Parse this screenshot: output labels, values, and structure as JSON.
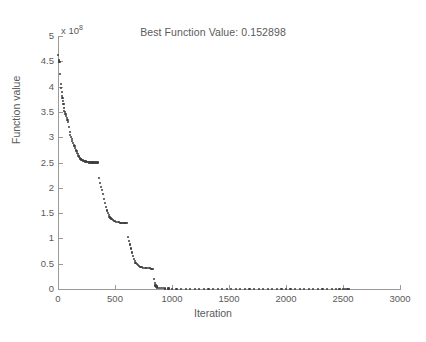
{
  "chart_data": {
    "type": "scatter",
    "title": "Best Function Value: 0.152898",
    "xlabel": "Iteration",
    "ylabel": "Function value",
    "y_exponent_prefix": "x 10",
    "y_exponent_power": "8",
    "y_scale_factor": 100000000,
    "xlim": [
      0,
      3000
    ],
    "ylim": [
      0,
      500000000
    ],
    "xticks": [
      0,
      500,
      1000,
      1500,
      2000,
      2500,
      3000
    ],
    "xtick_labels": [
      "0",
      "500",
      "1000",
      "1500",
      "2000",
      "2500",
      "3000"
    ],
    "yticks": [
      0,
      0.5,
      1,
      1.5,
      2,
      2.5,
      3,
      3.5,
      4,
      4.5,
      5
    ],
    "ytick_labels": [
      "0",
      "0.5",
      "1",
      "1.5",
      "2",
      "2.5",
      "3",
      "3.5",
      "4",
      "4.5",
      "5"
    ],
    "grid": false,
    "legend": null,
    "marker_color": "#3d3d3d",
    "axis_color": "#9a9a9a",
    "text_color": "#5a5a5a",
    "series_name": "Best function value per iteration",
    "note": "Monotone decreasing staircase; y values expressed in units of 1e8",
    "points": [
      [
        2,
        4.62
      ],
      [
        6,
        4.52
      ],
      [
        10,
        4.5
      ],
      [
        14,
        4.48
      ],
      [
        20,
        4.25
      ],
      [
        24,
        4.05
      ],
      [
        28,
        3.98
      ],
      [
        32,
        3.9
      ],
      [
        36,
        3.82
      ],
      [
        40,
        3.78
      ],
      [
        44,
        3.72
      ],
      [
        48,
        3.66
      ],
      [
        52,
        3.58
      ],
      [
        56,
        3.52
      ],
      [
        60,
        3.5
      ],
      [
        66,
        3.46
      ],
      [
        72,
        3.42
      ],
      [
        78,
        3.38
      ],
      [
        84,
        3.34
      ],
      [
        90,
        3.3
      ],
      [
        96,
        3.2
      ],
      [
        102,
        3.1
      ],
      [
        108,
        3.05
      ],
      [
        114,
        3.0
      ],
      [
        120,
        2.96
      ],
      [
        126,
        2.92
      ],
      [
        132,
        2.88
      ],
      [
        138,
        2.85
      ],
      [
        144,
        2.82
      ],
      [
        150,
        2.78
      ],
      [
        156,
        2.75
      ],
      [
        162,
        2.72
      ],
      [
        168,
        2.69
      ],
      [
        174,
        2.66
      ],
      [
        180,
        2.63
      ],
      [
        186,
        2.61
      ],
      [
        192,
        2.59
      ],
      [
        198,
        2.57
      ],
      [
        204,
        2.56
      ],
      [
        212,
        2.55
      ],
      [
        220,
        2.54
      ],
      [
        228,
        2.53
      ],
      [
        236,
        2.52
      ],
      [
        244,
        2.52
      ],
      [
        252,
        2.51
      ],
      [
        262,
        2.51
      ],
      [
        272,
        2.5
      ],
      [
        282,
        2.5
      ],
      [
        292,
        2.5
      ],
      [
        302,
        2.5
      ],
      [
        312,
        2.5
      ],
      [
        322,
        2.5
      ],
      [
        332,
        2.5
      ],
      [
        342,
        2.5
      ],
      [
        352,
        2.5
      ],
      [
        362,
        2.2
      ],
      [
        372,
        2.1
      ],
      [
        380,
        2.02
      ],
      [
        388,
        1.95
      ],
      [
        396,
        1.88
      ],
      [
        404,
        1.78
      ],
      [
        412,
        1.7
      ],
      [
        420,
        1.62
      ],
      [
        428,
        1.55
      ],
      [
        436,
        1.5
      ],
      [
        444,
        1.46
      ],
      [
        452,
        1.42
      ],
      [
        460,
        1.4
      ],
      [
        470,
        1.38
      ],
      [
        480,
        1.36
      ],
      [
        490,
        1.35
      ],
      [
        500,
        1.34
      ],
      [
        512,
        1.33
      ],
      [
        524,
        1.32
      ],
      [
        536,
        1.32
      ],
      [
        548,
        1.31
      ],
      [
        560,
        1.31
      ],
      [
        572,
        1.3
      ],
      [
        584,
        1.3
      ],
      [
        596,
        1.3
      ],
      [
        608,
        1.3
      ],
      [
        616,
        1.02
      ],
      [
        624,
        0.95
      ],
      [
        632,
        0.88
      ],
      [
        640,
        0.8
      ],
      [
        648,
        0.72
      ],
      [
        656,
        0.65
      ],
      [
        664,
        0.6
      ],
      [
        672,
        0.55
      ],
      [
        680,
        0.52
      ],
      [
        690,
        0.49
      ],
      [
        700,
        0.47
      ],
      [
        712,
        0.45
      ],
      [
        724,
        0.44
      ],
      [
        736,
        0.43
      ],
      [
        748,
        0.42
      ],
      [
        760,
        0.42
      ],
      [
        772,
        0.41
      ],
      [
        784,
        0.41
      ],
      [
        796,
        0.41
      ],
      [
        808,
        0.41
      ],
      [
        820,
        0.4
      ],
      [
        832,
        0.4
      ],
      [
        840,
        0.2
      ],
      [
        848,
        0.12
      ],
      [
        856,
        0.07
      ],
      [
        864,
        0.05
      ],
      [
        872,
        0.03
      ],
      [
        884,
        0.02
      ],
      [
        900,
        0.015
      ],
      [
        920,
        0.012
      ],
      [
        940,
        0.01
      ],
      [
        970,
        0.008
      ],
      [
        1000,
        0.006
      ],
      [
        1040,
        0.005
      ],
      [
        1080,
        0.004
      ],
      [
        1120,
        0.004
      ],
      [
        1160,
        0.003
      ],
      [
        1200,
        0.003
      ],
      [
        1240,
        0.003
      ],
      [
        1280,
        0.002
      ],
      [
        1320,
        0.002
      ],
      [
        1360,
        0.002
      ],
      [
        1400,
        0.002
      ],
      [
        1440,
        0.002
      ],
      [
        1480,
        0.002
      ],
      [
        1520,
        0.002
      ],
      [
        1560,
        0.002
      ],
      [
        1600,
        0.002
      ],
      [
        1640,
        0.002
      ],
      [
        1680,
        0.002
      ],
      [
        1720,
        0.002
      ],
      [
        1760,
        0.002
      ],
      [
        1800,
        0.002
      ],
      [
        1840,
        0.002
      ],
      [
        1880,
        0.002
      ],
      [
        1920,
        0.002
      ],
      [
        1960,
        0.002
      ],
      [
        2000,
        0.002
      ],
      [
        2040,
        0.002
      ],
      [
        2080,
        0.002
      ],
      [
        2120,
        0.002
      ],
      [
        2160,
        0.002
      ],
      [
        2200,
        0.002
      ],
      [
        2240,
        0.002
      ],
      [
        2280,
        0.002
      ],
      [
        2320,
        0.002
      ],
      [
        2360,
        0.002
      ],
      [
        2400,
        0.002
      ],
      [
        2440,
        0.002
      ],
      [
        2470,
        0.002
      ],
      [
        2500,
        0.002
      ],
      [
        2520,
        0.002
      ],
      [
        2540,
        0.002
      ],
      [
        2550,
        0.002
      ]
    ]
  }
}
